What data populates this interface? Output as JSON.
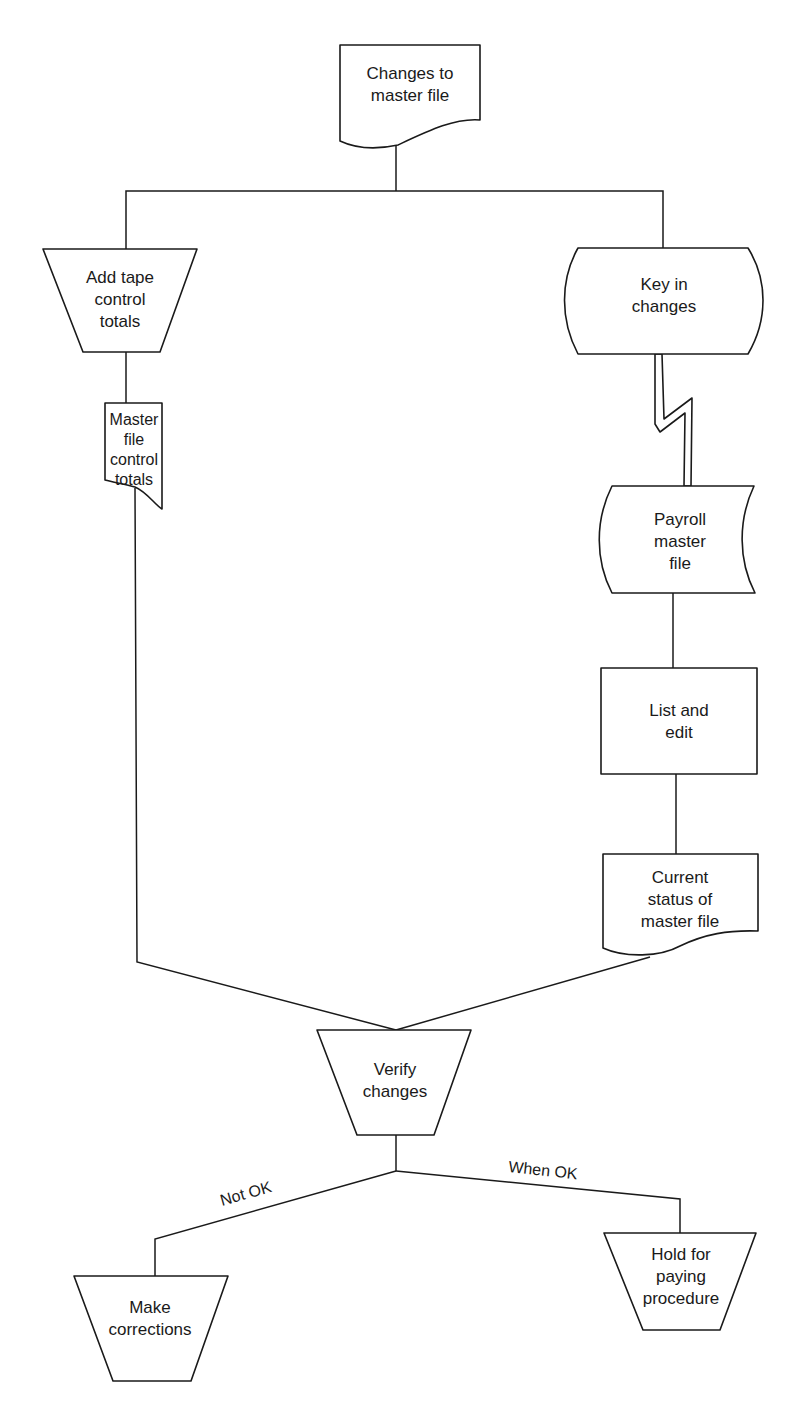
{
  "diagram": {
    "type": "system-flowchart",
    "colors": {
      "stroke": "#1a1a1a",
      "background": "#ffffff"
    },
    "nodes": {
      "changes_doc": {
        "shape": "document",
        "lines": [
          "Changes to",
          "master file"
        ]
      },
      "add_tape": {
        "shape": "manual-operation",
        "lines": [
          "Add tape",
          "control",
          "totals"
        ]
      },
      "master_totals": {
        "shape": "document",
        "lines": [
          "Master",
          "file",
          "control",
          "totals"
        ]
      },
      "key_in": {
        "shape": "online-keyboard",
        "lines": [
          "Key in",
          "changes"
        ]
      },
      "payroll_master": {
        "shape": "online-storage",
        "lines": [
          "Payroll",
          "master",
          "file"
        ]
      },
      "list_edit": {
        "shape": "process",
        "lines": [
          "List and",
          "edit"
        ]
      },
      "current_status": {
        "shape": "document",
        "lines": [
          "Current",
          "status of",
          "master file"
        ]
      },
      "verify": {
        "shape": "manual-operation",
        "lines": [
          "Verify",
          "changes"
        ]
      },
      "make_corrections": {
        "shape": "manual-operation",
        "lines": [
          "Make",
          "corrections"
        ]
      },
      "hold": {
        "shape": "manual-operation",
        "lines": [
          "Hold for",
          "paying",
          "procedure"
        ]
      }
    },
    "edge_labels": {
      "not_ok": "Not OK",
      "when_ok": "When OK"
    },
    "edges": [
      {
        "from": "changes_doc",
        "to": "add_tape"
      },
      {
        "from": "changes_doc",
        "to": "key_in"
      },
      {
        "from": "add_tape",
        "to": "master_totals"
      },
      {
        "from": "key_in",
        "to": "payroll_master",
        "style": "communication-link"
      },
      {
        "from": "payroll_master",
        "to": "list_edit"
      },
      {
        "from": "list_edit",
        "to": "current_status"
      },
      {
        "from": "master_totals",
        "to": "verify"
      },
      {
        "from": "current_status",
        "to": "verify"
      },
      {
        "from": "verify",
        "to": "make_corrections",
        "label": "Not OK"
      },
      {
        "from": "verify",
        "to": "hold",
        "label": "When OK"
      }
    ]
  }
}
